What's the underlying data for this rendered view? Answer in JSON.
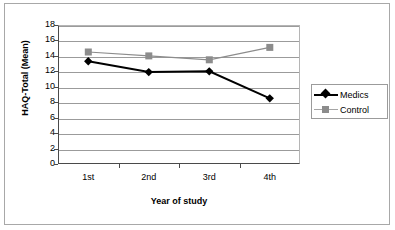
{
  "chart_data": {
    "type": "line",
    "title": "",
    "xlabel": "Year of study",
    "ylabel": "HAQ-Total (Mean)",
    "categories": [
      "1st",
      "2nd",
      "3rd",
      "4th"
    ],
    "ylim": [
      0,
      18
    ],
    "ytick_step": 2,
    "yticks": [
      "18",
      "16",
      "14",
      "12",
      "10",
      "8",
      "6",
      "4",
      "2",
      "0"
    ],
    "grid": true,
    "legend_position": "right",
    "series": [
      {
        "name": "Medics",
        "values": [
          13.3,
          11.9,
          12.0,
          8.5
        ],
        "color": "#000000",
        "marker": "diamond"
      },
      {
        "name": "Control",
        "values": [
          14.5,
          14.0,
          13.5,
          15.1
        ],
        "color": "#8c8c8c",
        "marker": "square"
      }
    ]
  },
  "legend": {
    "items": [
      {
        "label": "Medics"
      },
      {
        "label": "Control"
      }
    ]
  }
}
